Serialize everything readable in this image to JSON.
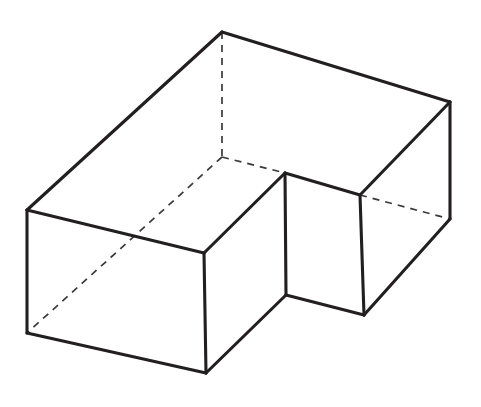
{
  "figure": {
    "title": "Axonometric line drawing of an L-shaped (notched) rectangular block",
    "canvas": {
      "width": 481,
      "height": 407,
      "background": "#ffffff"
    },
    "style": {
      "visible_edge_color": "#231f20",
      "visible_edge_width": 3.1,
      "hidden_edge_color": "#3a3a3c",
      "hidden_edge_width": 1.7,
      "hidden_edge_dash": "7 6",
      "face_fill": "#ffffff"
    },
    "vertices": {
      "apex_top_back": {
        "x": 222,
        "y": 32,
        "label": "A"
      },
      "left_top_back": {
        "x": 27,
        "y": 210,
        "label": "B"
      },
      "left_bottom_front": {
        "x": 27,
        "y": 333,
        "label": "C"
      },
      "front_bottom_mid": {
        "x": 206,
        "y": 373,
        "label": "D"
      },
      "front_top_mid": {
        "x": 204,
        "y": 253,
        "label": "E"
      },
      "notch_top_corner": {
        "x": 285,
        "y": 173,
        "label": "F"
      },
      "notch_bottom_corner": {
        "x": 286,
        "y": 295,
        "label": "G"
      },
      "inner_step_top": {
        "x": 360,
        "y": 195,
        "label": "H"
      },
      "right_bottom_front": {
        "x": 364,
        "y": 315,
        "label": "I"
      },
      "right_top_back": {
        "x": 450,
        "y": 102,
        "label": "J"
      },
      "right_bottom_back": {
        "x": 450,
        "y": 219,
        "label": "K"
      },
      "hidden_inner_corner": {
        "x": 222,
        "y": 157,
        "label": "L"
      }
    },
    "visible_edges": [
      {
        "name": "top-back-left-rim",
        "from": "apex_top_back",
        "to": "left_top_back"
      },
      {
        "name": "top-back-right-rim",
        "from": "apex_top_back",
        "to": "right_top_back"
      },
      {
        "name": "left-vertical-edge",
        "from": "left_top_back",
        "to": "left_bottom_front"
      },
      {
        "name": "left-top-front-rim",
        "from": "left_top_back",
        "to": "front_top_mid"
      },
      {
        "name": "left-bottom-front-edge",
        "from": "left_bottom_front",
        "to": "front_bottom_mid"
      },
      {
        "name": "front-center-vertical-edge",
        "from": "front_top_mid",
        "to": "front_bottom_mid"
      },
      {
        "name": "notch-left-top-rim",
        "from": "front_top_mid",
        "to": "notch_top_corner"
      },
      {
        "name": "notch-front-vertical-edge",
        "from": "notch_top_corner",
        "to": "notch_bottom_corner"
      },
      {
        "name": "notch-bottom-left-edge",
        "from": "front_bottom_mid",
        "to": "notch_bottom_corner"
      },
      {
        "name": "notch-right-top-rim",
        "from": "notch_top_corner",
        "to": "inner_step_top"
      },
      {
        "name": "step-vertical-edge",
        "from": "inner_step_top",
        "to": "right_bottom_front"
      },
      {
        "name": "notch-bottom-right-edge",
        "from": "notch_bottom_corner",
        "to": "right_bottom_front"
      },
      {
        "name": "right-top-front-rim",
        "from": "right_top_back",
        "to": "inner_step_top"
      },
      {
        "name": "right-vertical-edge",
        "from": "right_top_back",
        "to": "right_bottom_back"
      },
      {
        "name": "right-bottom-front-edge",
        "from": "right_bottom_back",
        "to": "right_bottom_front"
      }
    ],
    "hidden_edges": [
      {
        "name": "hidden-vertical-back-corner",
        "from": "apex_top_back",
        "to": "hidden_inner_corner"
      },
      {
        "name": "hidden-floor-diagonal-left",
        "from": "hidden_inner_corner",
        "to": "left_bottom_front"
      },
      {
        "name": "hidden-floor-edge-right",
        "from": "hidden_inner_corner",
        "to": "notch_top_corner"
      },
      {
        "name": "hidden-floor-edge-far-right",
        "from": "inner_step_top",
        "to": "right_bottom_back"
      }
    ],
    "faces": [
      {
        "name": "left-outer-face",
        "path": "left_top_back,front_top_mid,front_bottom_mid,left_bottom_front"
      },
      {
        "name": "top-left-rim-face",
        "path": "apex_top_back,left_top_back,front_top_mid,notch_top_corner"
      },
      {
        "name": "notch-front-face",
        "path": "notch_top_corner,notch_bottom_corner,front_bottom_mid,front_top_mid"
      },
      {
        "name": "notch-right-face",
        "path": "notch_top_corner,inner_step_top,right_bottom_front,notch_bottom_corner"
      },
      {
        "name": "top-right-rim-face",
        "path": "apex_top_back,right_top_back,inner_step_top,notch_top_corner"
      },
      {
        "name": "right-outer-face",
        "path": "right_top_back,right_bottom_back,right_bottom_front,inner_step_top"
      }
    ]
  }
}
